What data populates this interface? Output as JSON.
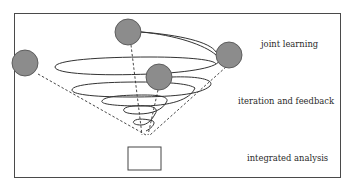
{
  "diagram": {
    "labels": {
      "top": "joint learning",
      "middle": "iteration and feedback",
      "bottom": "integrated analysis"
    },
    "nodes": [
      {
        "id": "node-left",
        "cx": 25,
        "cy": 63
      },
      {
        "id": "node-top",
        "cx": 128,
        "cy": 32
      },
      {
        "id": "node-right",
        "cx": 229,
        "cy": 55
      },
      {
        "id": "node-center",
        "cx": 159,
        "cy": 77
      }
    ],
    "colors": {
      "node_fill": "#8c8c8c",
      "node_stroke": "#555555",
      "line": "#333333",
      "frame": "#4a4a4a"
    }
  }
}
